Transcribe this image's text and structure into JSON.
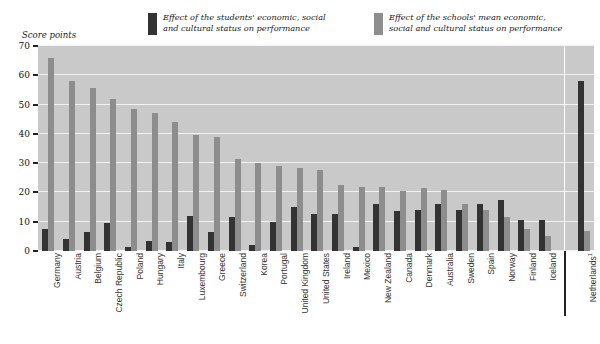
{
  "axis_title": "Score points",
  "legend": [
    {
      "swatch_color": "#333333",
      "label": "Effect of the students' economic, social and cultural status on performance"
    },
    {
      "swatch_color": "#8d8d8d",
      "label": "Effect of the schools' mean economic, social and cultural status on performance"
    }
  ],
  "chart_data": {
    "type": "bar",
    "title": "",
    "xlabel": "",
    "ylabel": "Score points",
    "ylim": [
      0,
      70
    ],
    "yticks": [
      0,
      10,
      20,
      30,
      40,
      50,
      60,
      70
    ],
    "grid": true,
    "legend_position": "top",
    "categories": [
      "Germany",
      "Austria",
      "Belgium",
      "Czech Republic",
      "Poland",
      "Hungary",
      "Italy",
      "Luxembourg",
      "Greece",
      "Switzerland",
      "Korea",
      "Portugal",
      "United Kingdom",
      "United States",
      "Ireland",
      "Mexico",
      "New Zealand",
      "Canada",
      "Denmark",
      "Australia",
      "Sweden",
      "Spain",
      "Norway",
      "Finland",
      "Iceland",
      "Netherlands¹"
    ],
    "series": [
      {
        "name": "Effect of the students' economic, social and cultural status on performance",
        "color": "#333333",
        "values": [
          7.5,
          4.0,
          6.5,
          9.5,
          1.5,
          3.5,
          3.0,
          12.0,
          6.5,
          11.5,
          2.0,
          10.0,
          15.0,
          12.5,
          12.5,
          1.5,
          16.0,
          13.5,
          14.0,
          16.0,
          14.0,
          16.0,
          17.5,
          10.5,
          10.5,
          58.0
        ]
      },
      {
        "name": "Effect of the schools' mean economic, social and cultural status on performance",
        "color": "#8d8d8d",
        "values": [
          66.0,
          58.0,
          55.5,
          52.0,
          48.5,
          47.0,
          44.0,
          39.5,
          39.0,
          31.5,
          30.0,
          29.0,
          28.5,
          27.5,
          22.5,
          22.0,
          22.0,
          20.5,
          21.5,
          21.0,
          16.0,
          14.0,
          11.5,
          7.5,
          5.0,
          7.0
        ]
      }
    ],
    "separator_after_category": "Iceland",
    "footnote_marker": "1"
  }
}
